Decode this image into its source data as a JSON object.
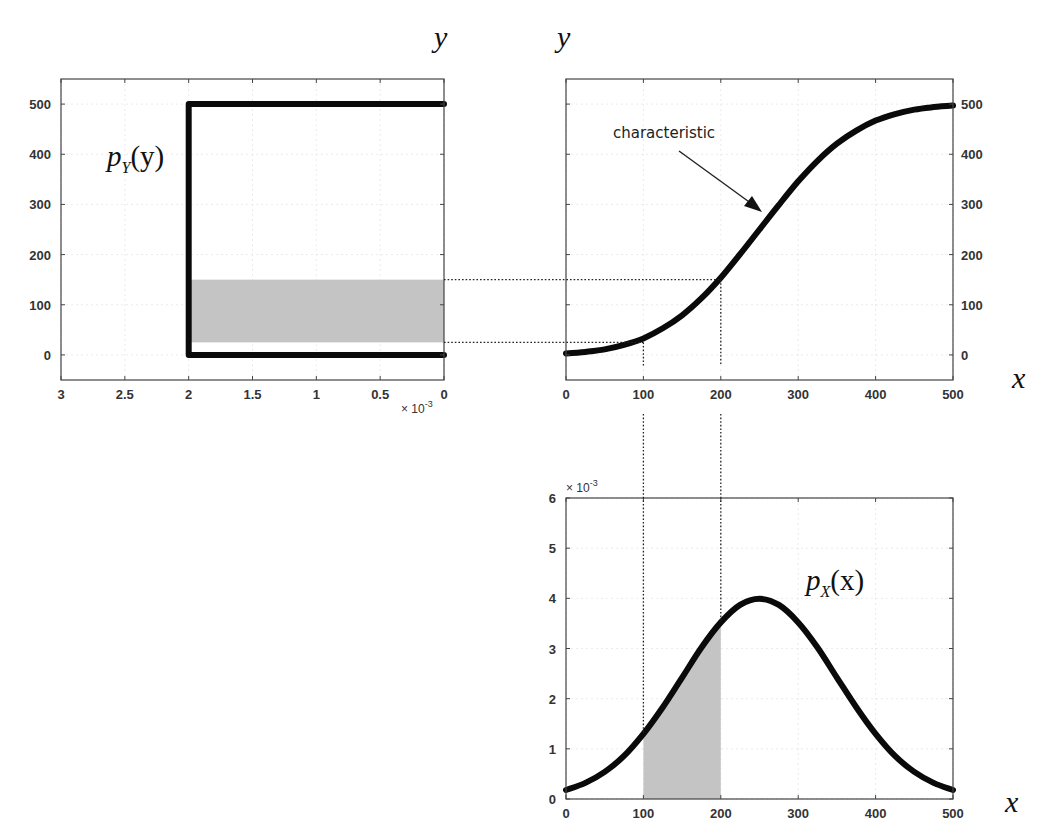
{
  "figure": {
    "top_axis_labels": [
      "y",
      "y"
    ],
    "x_axis_label": "x",
    "annotation": "characteristic",
    "left_plot_label": {
      "main": "p",
      "sub": "Y",
      "arg": "(y)"
    },
    "bottom_plot_label": {
      "main": "p",
      "sub": "X",
      "arg": "(x)"
    },
    "left_plot_exponent": "× 10",
    "left_plot_exponent_power": "-3",
    "bottom_plot_exponent": "× 10",
    "bottom_plot_exponent_power": "-3"
  },
  "chart_data": [
    {
      "id": "pY",
      "type": "line",
      "title": "p_Y(y)",
      "xlabel": "",
      "ylabel": "y",
      "x_scale_note": "× 10^-3",
      "xlim": [
        3,
        0
      ],
      "x_reversed": true,
      "ylim": [
        -50,
        550
      ],
      "xticks": [
        "3",
        "2.5",
        "2",
        "1.5",
        "1",
        "0.5",
        "0"
      ],
      "yticks": [
        "0",
        "100",
        "200",
        "300",
        "400",
        "500"
      ],
      "grid": true,
      "series": [
        {
          "name": "p_Y(y)",
          "x": [
            0,
            2,
            2,
            0
          ],
          "y": [
            500,
            500,
            0,
            0
          ]
        }
      ],
      "shaded_region": {
        "y_from": 25,
        "y_to": 150,
        "x_from": 2,
        "x_to": 0
      }
    },
    {
      "id": "characteristic",
      "type": "line",
      "title": "characteristic",
      "xlabel": "x",
      "ylabel": "y",
      "xlim": [
        0,
        500
      ],
      "ylim": [
        -50,
        550
      ],
      "xticks": [
        "0",
        "100",
        "200",
        "300",
        "400",
        "500"
      ],
      "yticks": [
        "0",
        "100",
        "200",
        "300",
        "400",
        "500"
      ],
      "y_axis_side": "right",
      "grid": true,
      "series": [
        {
          "name": "y = g(x)",
          "x": [
            0,
            25,
            50,
            75,
            100,
            125,
            150,
            175,
            200,
            225,
            250,
            275,
            300,
            325,
            350,
            375,
            400,
            425,
            450,
            475,
            500
          ],
          "y": [
            3,
            6,
            11,
            20,
            33,
            53,
            79,
            113,
            154,
            201,
            250,
            299,
            346,
            387,
            421,
            447,
            467,
            480,
            489,
            494,
            497
          ]
        }
      ],
      "guide_lines": {
        "x": [
          100,
          200
        ],
        "y": [
          25,
          150
        ]
      },
      "annotation": {
        "text": "characteristic",
        "arrow_to": [
          250,
          290
        ]
      }
    },
    {
      "id": "pX",
      "type": "line",
      "title": "p_X(x)",
      "xlabel": "x",
      "ylabel": "",
      "y_scale_note": "× 10^-3",
      "xlim": [
        0,
        500
      ],
      "ylim": [
        0,
        6
      ],
      "xticks": [
        "0",
        "100",
        "200",
        "300",
        "400",
        "500"
      ],
      "yticks": [
        "0",
        "1",
        "2",
        "3",
        "4",
        "5",
        "6"
      ],
      "grid": true,
      "series": [
        {
          "name": "p_X(x) (×10^-3)",
          "x": [
            0,
            25,
            50,
            75,
            100,
            125,
            150,
            175,
            200,
            225,
            250,
            275,
            300,
            325,
            350,
            375,
            400,
            425,
            450,
            475,
            500
          ],
          "y": [
            0.18,
            0.32,
            0.54,
            0.86,
            1.3,
            1.83,
            2.42,
            3.02,
            3.52,
            3.87,
            3.99,
            3.87,
            3.52,
            3.02,
            2.42,
            1.83,
            1.3,
            0.86,
            0.54,
            0.32,
            0.18
          ]
        }
      ],
      "shaded_region": {
        "x_from": 100,
        "x_to": 200
      }
    }
  ]
}
